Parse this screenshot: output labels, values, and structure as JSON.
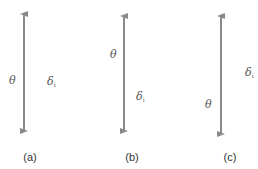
{
  "colors": {
    "arrow": "#8a8a8a",
    "text": "#555555",
    "caption": "#333333"
  },
  "panels": [
    {
      "caption": "(a)",
      "caption_pos": {
        "x": 30,
        "y": 152
      },
      "arrow": {
        "x": 24,
        "y1": 8,
        "y2": 137
      },
      "theta": {
        "symbol": "θ",
        "x": 9,
        "y": 75
      },
      "delta": {
        "symbol": "δ",
        "subscript": "i",
        "x": 47,
        "y": 76
      }
    },
    {
      "caption": "(b)",
      "caption_pos": {
        "x": 132,
        "y": 152
      },
      "arrow": {
        "x": 124,
        "y1": 10,
        "y2": 137
      },
      "theta": {
        "symbol": "θ",
        "x": 110,
        "y": 49
      },
      "delta": {
        "symbol": "δ",
        "subscript": "i",
        "x": 136,
        "y": 91
      }
    },
    {
      "caption": "(c)",
      "caption_pos": {
        "x": 230,
        "y": 152
      },
      "arrow": {
        "x": 221,
        "y1": 10,
        "y2": 140
      },
      "theta": {
        "symbol": "θ",
        "x": 205,
        "y": 99
      },
      "delta": {
        "symbol": "δ",
        "subscript": "i",
        "x": 245,
        "y": 67
      }
    }
  ]
}
